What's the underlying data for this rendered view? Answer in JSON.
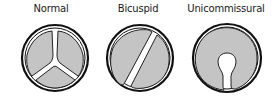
{
  "diagram": {
    "valves": [
      {
        "label": "Normal",
        "cusps": 3
      },
      {
        "label": "Bicuspid",
        "cusps": 2
      },
      {
        "label": "Unicommissural",
        "cusps": 1
      }
    ],
    "colors": {
      "outline": "#111111",
      "cusp_fill": "#c4c4c4",
      "background": "#ffffff"
    }
  }
}
